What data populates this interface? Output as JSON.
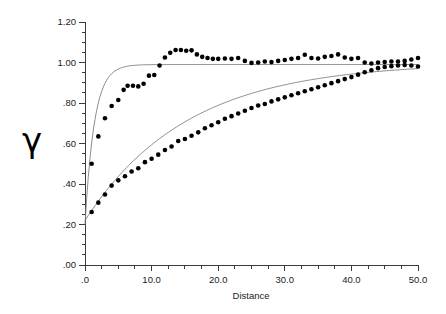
{
  "chart_data": {
    "type": "scatter",
    "title": "",
    "subtitle": "",
    "xlabel": "Distance",
    "ylabel": "γ",
    "xlim": [
      0,
      50
    ],
    "ylim": [
      0.0,
      1.2
    ],
    "grid": false,
    "legend": "none",
    "x_ticks": [
      {
        "value": 0,
        "label": ".0"
      },
      {
        "value": 10,
        "label": "10.0"
      },
      {
        "value": 20,
        "label": "20.0"
      },
      {
        "value": 30,
        "label": "30.0"
      },
      {
        "value": 40,
        "label": "40.0"
      },
      {
        "value": 50,
        "label": "50.0"
      }
    ],
    "x_minor_step": 2.5,
    "y_ticks": [
      {
        "value": 0.0,
        "label": ".00"
      },
      {
        "value": 0.2,
        "label": ".20"
      },
      {
        "value": 0.4,
        "label": ".40"
      },
      {
        "value": 0.6,
        "label": ".60"
      },
      {
        "value": 0.8,
        "label": ".80"
      },
      {
        "value": 1.0,
        "label": "1.00"
      },
      {
        "value": 1.2,
        "label": "1.20"
      }
    ],
    "y_minor_step": 0.05,
    "marker_color": "#000000",
    "curve_color": "#808080",
    "axis_color": "#3a3a3a",
    "series": [
      {
        "name": "upper-variogram",
        "marker": "filled-circle",
        "points": [
          [
            1.0,
            0.5
          ],
          [
            2.0,
            0.635
          ],
          [
            3.0,
            0.725
          ],
          [
            4.0,
            0.785
          ],
          [
            5.0,
            0.815
          ],
          [
            5.8,
            0.865
          ],
          [
            6.4,
            0.885
          ],
          [
            7.2,
            0.885
          ],
          [
            8.0,
            0.882
          ],
          [
            8.8,
            0.895
          ],
          [
            9.6,
            0.935
          ],
          [
            10.4,
            0.938
          ],
          [
            11.2,
            0.985
          ],
          [
            12.0,
            1.025
          ],
          [
            12.8,
            1.048
          ],
          [
            13.6,
            1.062
          ],
          [
            14.4,
            1.062
          ],
          [
            15.2,
            1.058
          ],
          [
            16.0,
            1.06
          ],
          [
            16.8,
            1.04
          ],
          [
            17.6,
            1.028
          ],
          [
            18.4,
            1.022
          ],
          [
            19.2,
            1.018
          ],
          [
            20.0,
            1.018
          ],
          [
            21.0,
            1.02
          ],
          [
            22.0,
            1.018
          ],
          [
            23.0,
            1.022
          ],
          [
            24.0,
            1.008
          ],
          [
            25.0,
            0.998
          ],
          [
            26.0,
            1.0
          ],
          [
            27.0,
            1.005
          ],
          [
            28.0,
            1.002
          ],
          [
            29.0,
            1.008
          ],
          [
            30.0,
            1.012
          ],
          [
            31.0,
            1.018
          ],
          [
            32.0,
            1.022
          ],
          [
            33.0,
            1.038
          ],
          [
            34.0,
            1.022
          ],
          [
            35.0,
            1.02
          ],
          [
            36.0,
            1.028
          ],
          [
            37.0,
            1.032
          ],
          [
            38.0,
            1.04
          ],
          [
            39.0,
            1.025
          ],
          [
            40.0,
            1.018
          ],
          [
            41.0,
            1.022
          ],
          [
            42.0,
            1.0
          ],
          [
            43.0,
            0.995
          ],
          [
            44.0,
            1.0
          ],
          [
            45.0,
            1.002
          ],
          [
            46.0,
            1.005
          ],
          [
            47.0,
            1.005
          ],
          [
            48.0,
            1.008
          ],
          [
            49.0,
            1.015
          ],
          [
            50.0,
            1.022
          ]
        ],
        "fit": {
          "model": "exponential",
          "nugget": 0.2,
          "sill": 0.99,
          "range": 4.2
        }
      },
      {
        "name": "lower-variogram",
        "marker": "filled-circle",
        "points": [
          [
            1.0,
            0.262
          ],
          [
            2.0,
            0.308
          ],
          [
            3.0,
            0.348
          ],
          [
            4.0,
            0.392
          ],
          [
            5.0,
            0.418
          ],
          [
            6.0,
            0.438
          ],
          [
            7.0,
            0.462
          ],
          [
            8.0,
            0.478
          ],
          [
            9.0,
            0.508
          ],
          [
            10.0,
            0.525
          ],
          [
            11.0,
            0.545
          ],
          [
            12.0,
            0.568
          ],
          [
            13.0,
            0.585
          ],
          [
            14.0,
            0.612
          ],
          [
            15.0,
            0.622
          ],
          [
            16.0,
            0.638
          ],
          [
            17.0,
            0.655
          ],
          [
            18.0,
            0.675
          ],
          [
            19.0,
            0.69
          ],
          [
            20.0,
            0.705
          ],
          [
            21.0,
            0.722
          ],
          [
            22.0,
            0.735
          ],
          [
            23.0,
            0.748
          ],
          [
            24.0,
            0.762
          ],
          [
            25.0,
            0.775
          ],
          [
            26.0,
            0.788
          ],
          [
            27.0,
            0.795
          ],
          [
            28.0,
            0.808
          ],
          [
            29.0,
            0.818
          ],
          [
            30.0,
            0.828
          ],
          [
            31.0,
            0.838
          ],
          [
            32.0,
            0.848
          ],
          [
            33.0,
            0.858
          ],
          [
            34.0,
            0.868
          ],
          [
            35.0,
            0.878
          ],
          [
            36.0,
            0.888
          ],
          [
            37.0,
            0.898
          ],
          [
            38.0,
            0.908
          ],
          [
            39.0,
            0.918
          ],
          [
            40.0,
            0.928
          ],
          [
            41.0,
            0.94
          ],
          [
            42.0,
            0.952
          ],
          [
            43.0,
            0.962
          ],
          [
            44.0,
            0.972
          ],
          [
            45.0,
            0.978
          ],
          [
            46.0,
            0.982
          ],
          [
            47.0,
            0.985
          ],
          [
            48.0,
            0.988
          ],
          [
            49.0,
            0.985
          ],
          [
            50.0,
            0.98
          ]
        ],
        "fit": {
          "model": "exponential",
          "nugget": 0.22,
          "sill": 1.0,
          "range": 46.0
        }
      }
    ]
  }
}
